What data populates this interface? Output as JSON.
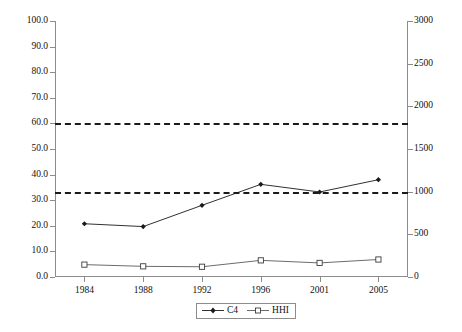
{
  "chart_data": {
    "type": "line",
    "title": "",
    "subtitle": "",
    "xlabel": "",
    "ylabel": "",
    "y2label": "",
    "grid": false,
    "legend_position": "bottom-center",
    "categories": [
      "1984",
      "1988",
      "1992",
      "1996",
      "2001",
      "2005"
    ],
    "x_tick_labels": [
      "1984",
      "1988",
      "1992",
      "1996",
      "2001",
      "2005"
    ],
    "ylim": [
      0,
      100
    ],
    "y_tick_labels": [
      "0.0",
      "10.0",
      "20.0",
      "30.0",
      "40.0",
      "50.0",
      "60.0",
      "70.0",
      "80.0",
      "90.0",
      "100.0"
    ],
    "y_tick_values": [
      0,
      10,
      20,
      30,
      40,
      50,
      60,
      70,
      80,
      90,
      100
    ],
    "y2lim": [
      0,
      3000
    ],
    "y2_tick_labels": [
      "0",
      "500",
      "1000",
      "1500",
      "2000",
      "2500",
      "3000"
    ],
    "y2_tick_values": [
      0,
      500,
      1000,
      1500,
      2000,
      2500,
      3000
    ],
    "series": [
      {
        "name": "C4",
        "axis": "left",
        "marker": "filled-diamond",
        "color": "#1a1a1a",
        "values": [
          20.8,
          19.7,
          28.0,
          36.2,
          33.2,
          38.0
        ]
      },
      {
        "name": "HHI",
        "axis": "right",
        "marker": "open-square",
        "color": "#5a5a5a",
        "values": [
          145,
          125,
          120,
          195,
          165,
          205
        ]
      }
    ],
    "annotations": [
      {
        "name": "hhi-upper-threshold",
        "type": "hline",
        "axis": "right",
        "value": 1800,
        "style": "dashed",
        "color": "#1a1a1a"
      },
      {
        "name": "hhi-lower-threshold",
        "type": "hline",
        "axis": "right",
        "value": 1000,
        "style": "dashed",
        "color": "#1a1a1a"
      }
    ]
  },
  "legend": {
    "items": [
      {
        "label": "C4",
        "marker": "filled-diamond"
      },
      {
        "label": "HHI",
        "marker": "open-square"
      }
    ]
  },
  "artifact": {
    "bottom_text": " "
  }
}
